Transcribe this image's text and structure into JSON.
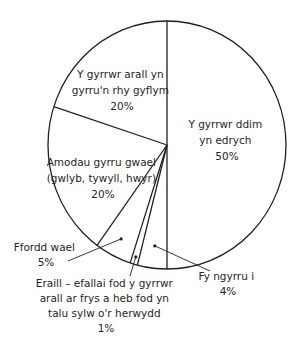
{
  "chart_data": {
    "type": "pie",
    "title": "",
    "categories": [
      "Y gyrrwr ddim yn edrych",
      "Fy ngyrru i",
      "Eraill – efallai fod y gyrrwr arall ar frys a heb fod yn talu sylw o'r herwydd",
      "Ffordd wael",
      "Amodau gyrru gwael (gwlyb, tywyll, hwyr)",
      "Y gyrrwr arall yn gyrru'n rhy gyflym"
    ],
    "values": [
      50,
      4,
      1,
      5,
      20,
      20
    ],
    "units": "%",
    "start_angle": "12 o'clock, clockwise",
    "colors": {
      "fill": "#ffffff",
      "stroke": "#231f20"
    }
  },
  "labels": {
    "s0": {
      "lines": [
        "Y gyrrwr ddim",
        "yn edrych",
        "50%"
      ]
    },
    "s1": {
      "lines": [
        "Fy ngyrru i",
        "4%"
      ]
    },
    "s2": {
      "lines": [
        "Eraill – efallai fod y gyrrwr",
        "arall ar frys a heb fod yn",
        "talu sylw o'r herwydd",
        "1%"
      ]
    },
    "s3": {
      "lines": [
        "Ffordd wael",
        "5%"
      ]
    },
    "s4": {
      "lines": [
        "Amodau gyrru gwael",
        "(gwlyb, tywyll, hwyr)",
        "20%"
      ]
    },
    "s5": {
      "lines": [
        "Y gyrrwr arall yn",
        "gyrru'n rhy gyflym",
        "20%"
      ]
    }
  }
}
